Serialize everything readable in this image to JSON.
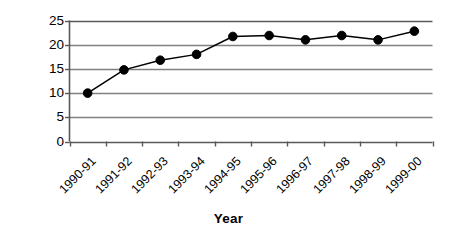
{
  "chart_data": {
    "type": "line",
    "title": "",
    "xlabel": "Year",
    "ylabel": "% Growth Rate",
    "categories": [
      "1990-91",
      "1991-92",
      "1992-93",
      "1993-94",
      "1994-95",
      "1995-96",
      "1996-97",
      "1997-98",
      "1998-99",
      "1999-00"
    ],
    "values": [
      10.0,
      14.8,
      16.8,
      18.0,
      21.7,
      21.9,
      21.0,
      21.9,
      21.0,
      22.8
    ],
    "series": [
      {
        "name": "% Growth Rate",
        "values": [
          10.0,
          14.8,
          16.8,
          18.0,
          21.7,
          21.9,
          21.0,
          21.9,
          21.0,
          22.8
        ]
      }
    ],
    "ylim": [
      0,
      25
    ],
    "yticks": [
      0,
      5,
      10,
      15,
      20,
      25
    ],
    "ytick_labels": [
      "0",
      "5",
      "10",
      "15",
      "20",
      "25"
    ],
    "grid": "horizontal",
    "legend": "none",
    "line_color": "#000000",
    "marker": "filled-circle",
    "marker_color": "#000000",
    "gridline_color": "#808080",
    "axis_color": "#595959",
    "background_color": "#ffffff"
  }
}
